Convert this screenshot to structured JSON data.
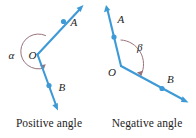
{
  "figure": {
    "colors": {
      "ray": "#3d9ad6",
      "arc": "#98737a",
      "text": "#1d1d1d",
      "background": "#ffffff"
    },
    "panels": [
      {
        "id": "positive",
        "caption": "Positive angle",
        "vertex_label": "O",
        "angle_label": "α",
        "ray_labels": {
          "upper": "A",
          "lower": "B"
        },
        "rotation_direction": "counterclockwise",
        "arc_type": "reflex"
      },
      {
        "id": "negative",
        "caption": "Negative angle",
        "vertex_label": "O",
        "angle_label": "β",
        "ray_labels": {
          "upper": "A",
          "lower": "B"
        },
        "rotation_direction": "clockwise",
        "arc_type": "obtuse"
      }
    ]
  }
}
